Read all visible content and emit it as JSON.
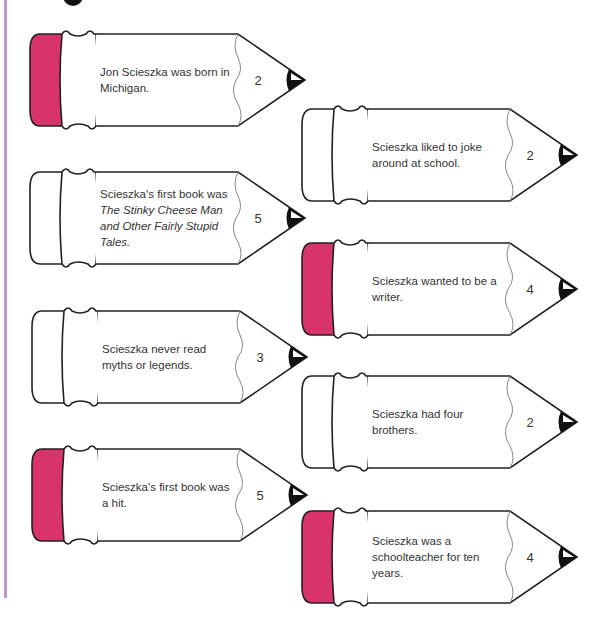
{
  "page": {
    "accent_border_color": "#b79ac9",
    "eraser_color": "#d8336b"
  },
  "pencils": [
    {
      "id": "L1",
      "text": "Jon Scieszka was born in Michigan.",
      "number": "2",
      "eraser_pink": true
    },
    {
      "id": "L2",
      "text_plain": "Scieszka's first book was ",
      "text_italic": "The Stinky Cheese Man and Other Fairly Stupid Tales.",
      "number": "5",
      "eraser_pink": false
    },
    {
      "id": "L3",
      "text": "Scieszka never read myths or legends.",
      "number": "3",
      "eraser_pink": false
    },
    {
      "id": "L4",
      "text": "Scieszka's first book was a hit.",
      "number": "5",
      "eraser_pink": true
    },
    {
      "id": "R1",
      "text": "Scieszka liked to joke around at school.",
      "number": "2",
      "eraser_pink": false
    },
    {
      "id": "R2",
      "text": "Scieszka wanted to be a writer.",
      "number": "4",
      "eraser_pink": true
    },
    {
      "id": "R3",
      "text": "Scieszka had four brothers.",
      "number": "2",
      "eraser_pink": false
    },
    {
      "id": "R4",
      "text": "Scieszka was a schoolteacher for ten years.",
      "number": "4",
      "eraser_pink": true
    }
  ]
}
